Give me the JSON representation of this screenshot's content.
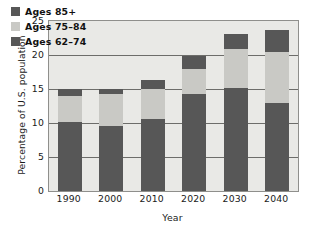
{
  "chart_data": {
    "type": "bar",
    "subtype": "stacked-vertical",
    "title": "",
    "xlabel": "Year",
    "ylabel": "Percentage of U.S. population",
    "categories": [
      "1990",
      "2000",
      "2010",
      "2020",
      "2030",
      "2040"
    ],
    "ylim": [
      0,
      25
    ],
    "yticks": [
      "25",
      "20",
      "15",
      "10",
      "5",
      "0"
    ],
    "ytick_values": [
      25,
      20,
      15,
      10,
      5,
      0
    ],
    "grid": true,
    "grid_axis": "y",
    "legend_position": "top-left-inside",
    "series": [
      {
        "name": "Ages 85+",
        "color": "#575757",
        "values": [
          1.0,
          0.8,
          1.4,
          1.8,
          2.2,
          3.3
        ]
      },
      {
        "name": "Ages 75–84",
        "color": "#c9c9c5",
        "values": [
          3.8,
          4.6,
          4.4,
          3.7,
          5.8,
          7.5
        ]
      },
      {
        "name": "Ages 62–74",
        "color": "#575757",
        "values": [
          10.2,
          9.6,
          10.6,
          14.3,
          15.1,
          12.9
        ]
      }
    ],
    "totals": [
      15.0,
      15.0,
      16.4,
      19.8,
      23.1,
      23.7
    ],
    "plot_background": "#e9e9e6",
    "axis_color": "#6d6d6a"
  },
  "legend": {
    "items": [
      {
        "label": "Ages 85+"
      },
      {
        "label": "Ages 75–84"
      },
      {
        "label": "Ages 62–74"
      }
    ]
  }
}
